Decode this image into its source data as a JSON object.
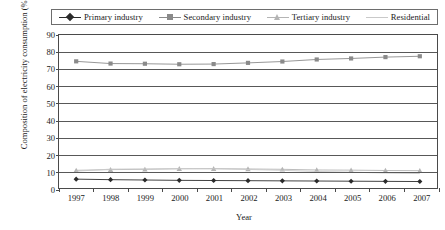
{
  "chart_data": {
    "type": "line",
    "title": "",
    "xlabel": "Year",
    "ylabel": "Composition of electricity consumption (%)",
    "categories": [
      "1997",
      "1998",
      "1999",
      "2000",
      "2001",
      "2002",
      "2003",
      "2004",
      "2005",
      "2006",
      "2007"
    ],
    "x": [
      1997,
      1998,
      1999,
      2000,
      2001,
      2002,
      2003,
      2004,
      2005,
      2006,
      2007
    ],
    "ylim": [
      0,
      90
    ],
    "yticks": [
      0,
      10,
      20,
      30,
      40,
      50,
      60,
      70,
      80,
      90
    ],
    "grid": "horizontal",
    "legend_position": "top",
    "series": [
      {
        "name": "Primary industry",
        "marker": "diamond",
        "color": "#2b2b2b",
        "values": [
          5.2,
          4.9,
          4.7,
          4.5,
          4.4,
          4.3,
          4.2,
          4.1,
          4.0,
          3.9,
          3.8
        ]
      },
      {
        "name": "Secondary industry",
        "marker": "square",
        "color": "#8a8a8a",
        "values": [
          74.5,
          73.2,
          73.1,
          72.8,
          72.9,
          73.6,
          74.4,
          75.6,
          76.2,
          77.0,
          77.5
        ]
      },
      {
        "name": "Tertiary industry",
        "marker": "triangle",
        "color": "#b4b4b4",
        "values": [
          10.4,
          10.8,
          11.0,
          11.3,
          11.4,
          11.2,
          11.0,
          10.6,
          10.5,
          10.3,
          10.2
        ]
      },
      {
        "name": "Residential",
        "marker": "none",
        "color": "#c9c9c9",
        "values": [
          9.9,
          11.1,
          11.2,
          11.4,
          11.3,
          10.9,
          10.4,
          9.7,
          9.3,
          8.8,
          8.5
        ]
      }
    ]
  },
  "legend": {
    "items": [
      {
        "label": "Primary industry"
      },
      {
        "label": "Secondary industry"
      },
      {
        "label": "Tertiary industry"
      },
      {
        "label": "Residential"
      }
    ]
  },
  "axes": {
    "y_title": "Composition of electricity consumption (%)",
    "x_title": "Year",
    "y_tick_labels": [
      "90",
      "80",
      "70",
      "60",
      "50",
      "40",
      "30",
      "20",
      "10",
      "0"
    ],
    "x_tick_labels": [
      "1997",
      "1998",
      "1999",
      "2000",
      "2001",
      "2002",
      "2003",
      "2004",
      "2005",
      "2006",
      "2007"
    ]
  }
}
